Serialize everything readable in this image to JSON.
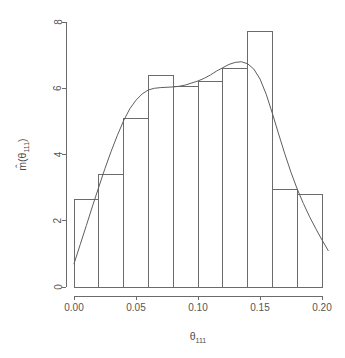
{
  "chart_data": {
    "type": "bar",
    "title": "",
    "subtitle": "",
    "xlabel": "θ111",
    "xlabel_base": "θ",
    "xlabel_sub": "111",
    "ylabel": "m̂(θ111)",
    "ylabel_base": "m̂(θ",
    "ylabel_sub": "111",
    "ylabel_tail": ")",
    "xlim": [
      0.0,
      0.2
    ],
    "ylim": [
      0,
      8
    ],
    "grid": false,
    "legend": false,
    "bin_width": 0.02,
    "bin_edges": [
      0.0,
      0.02,
      0.04,
      0.06,
      0.08,
      0.1,
      0.12,
      0.14,
      0.16,
      0.18,
      0.2
    ],
    "categories": [
      "0.00-0.02",
      "0.02-0.04",
      "0.04-0.06",
      "0.06-0.08",
      "0.08-0.10",
      "0.10-0.12",
      "0.12-0.14",
      "0.14-0.16",
      "0.16-0.18",
      "0.18-0.20"
    ],
    "values": [
      2.65,
      3.4,
      5.1,
      6.4,
      6.05,
      6.2,
      6.6,
      7.7,
      2.95,
      2.8
    ],
    "xticks": [
      0.0,
      0.05,
      0.1,
      0.15,
      0.2
    ],
    "xticklabels": [
      "0.00",
      "0.05",
      "0.10",
      "0.15",
      "0.20"
    ],
    "yticks": [
      0,
      2,
      4,
      6,
      8
    ],
    "yticklabels": [
      "0",
      "2",
      "4",
      "6",
      "8"
    ],
    "series": [
      {
        "name": "histogram",
        "type": "bar",
        "values": [
          2.65,
          3.4,
          5.1,
          6.4,
          6.05,
          6.2,
          6.6,
          7.7,
          2.95,
          2.8
        ]
      },
      {
        "name": "density-estimate",
        "type": "line",
        "x": [
          0.0,
          0.005,
          0.01,
          0.015,
          0.02,
          0.025,
          0.03,
          0.035,
          0.04,
          0.045,
          0.05,
          0.055,
          0.06,
          0.065,
          0.07,
          0.075,
          0.08,
          0.085,
          0.09,
          0.095,
          0.1,
          0.105,
          0.11,
          0.115,
          0.12,
          0.125,
          0.13,
          0.135,
          0.14,
          0.145,
          0.15,
          0.155,
          0.16,
          0.165,
          0.17,
          0.175,
          0.18,
          0.185,
          0.19,
          0.195,
          0.2,
          0.205
        ],
        "y": [
          0.7,
          1.28,
          1.86,
          2.45,
          3.02,
          3.58,
          4.1,
          4.58,
          5.02,
          5.38,
          5.64,
          5.83,
          5.95,
          6.0,
          6.02,
          6.03,
          6.04,
          6.06,
          6.1,
          6.16,
          6.22,
          6.3,
          6.4,
          6.52,
          6.62,
          6.72,
          6.78,
          6.8,
          6.74,
          6.58,
          6.28,
          5.82,
          5.24,
          4.62,
          4.02,
          3.46,
          2.96,
          2.52,
          2.12,
          1.76,
          1.42,
          1.1
        ]
      }
    ],
    "colors": {
      "axis": "#6b6b6b",
      "bar_stroke": "#6b6b6b",
      "bar_fill": "none",
      "curve": "#5e5e5e",
      "text": "#555555",
      "background": "#ffffff"
    },
    "geometry": {
      "x0_px": 74,
      "x1_px": 322,
      "y0_px": 287,
      "y8_px": 22
    }
  }
}
